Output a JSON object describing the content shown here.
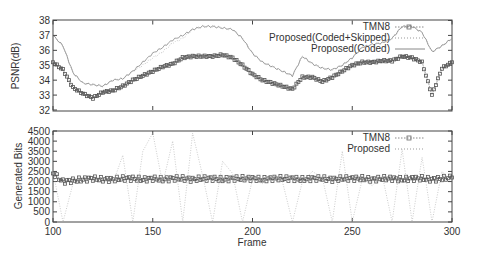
{
  "chart_data": [
    {
      "type": "line",
      "title": "",
      "xlabel": "",
      "ylabel": "PSNR(dB)",
      "xlim": [
        100,
        300
      ],
      "ylim": [
        32,
        38
      ],
      "yticks": [
        32,
        33,
        34,
        35,
        36,
        37,
        38
      ],
      "xticks": [
        100,
        150,
        200,
        250,
        300
      ],
      "grid": false,
      "legend_position": "top-right",
      "x": [
        100,
        105,
        110,
        115,
        120,
        125,
        130,
        135,
        140,
        145,
        150,
        155,
        160,
        165,
        170,
        175,
        180,
        185,
        190,
        195,
        200,
        205,
        210,
        215,
        220,
        225,
        230,
        235,
        240,
        245,
        250,
        255,
        260,
        265,
        270,
        275,
        280,
        285,
        290,
        295,
        300
      ],
      "series": [
        {
          "name": "TMN8",
          "style": "dotted with square markers",
          "values": [
            35.2,
            34.7,
            33.5,
            33.1,
            32.8,
            33.2,
            33.3,
            33.6,
            34.0,
            34.3,
            34.6,
            34.9,
            35.1,
            35.5,
            35.6,
            35.6,
            35.6,
            35.7,
            35.5,
            35.0,
            34.4,
            34.0,
            33.8,
            33.6,
            33.4,
            34.2,
            34.2,
            33.9,
            34.2,
            34.6,
            35.0,
            35.2,
            35.2,
            35.3,
            35.3,
            35.6,
            35.5,
            35.2,
            33.0,
            34.8,
            35.2
          ]
        },
        {
          "name": "Proposed(Coded+Skipped)",
          "style": "dotted with small markers, drops at skipped frames",
          "values": [
            37.0,
            36.3,
            34.5,
            33.8,
            33.7,
            33.6,
            34.0,
            34.1,
            34.6,
            35.0,
            35.5,
            35.9,
            36.5,
            36.8,
            37.4,
            37.6,
            37.6,
            37.5,
            37.4,
            36.8,
            35.8,
            35.2,
            34.9,
            34.6,
            34.3,
            35.6,
            35.1,
            34.8,
            34.7,
            35.0,
            35.5,
            36.2,
            36.4,
            36.5,
            36.8,
            37.6,
            37.6,
            37.2,
            35.9,
            36.3,
            36.8
          ]
        },
        {
          "name": "Proposed(Coded)",
          "style": "solid thin line",
          "values": [
            37.0,
            36.3,
            34.5,
            33.8,
            33.7,
            33.6,
            34.0,
            34.1,
            34.6,
            35.2,
            35.8,
            36.2,
            36.7,
            37.0,
            37.4,
            37.6,
            37.6,
            37.5,
            37.4,
            36.8,
            35.8,
            35.2,
            34.9,
            34.6,
            34.3,
            35.6,
            35.1,
            34.8,
            34.7,
            35.0,
            35.5,
            36.2,
            36.4,
            36.5,
            36.8,
            37.6,
            37.6,
            37.2,
            35.9,
            36.3,
            36.8
          ]
        }
      ]
    },
    {
      "type": "line",
      "title": "",
      "xlabel": "Frame",
      "ylabel": "Generated Bits",
      "xlim": [
        100,
        300
      ],
      "ylim": [
        0,
        4500
      ],
      "yticks": [
        0,
        500,
        1000,
        1500,
        2000,
        2500,
        3000,
        3500,
        4000,
        4500
      ],
      "xticks": [
        100,
        150,
        200,
        250,
        300
      ],
      "grid": false,
      "legend_position": "top-right",
      "x": [
        100,
        105,
        110,
        115,
        120,
        125,
        130,
        135,
        140,
        145,
        150,
        155,
        160,
        165,
        170,
        175,
        180,
        185,
        190,
        195,
        200,
        205,
        210,
        215,
        220,
        225,
        230,
        235,
        240,
        245,
        250,
        255,
        260,
        265,
        270,
        275,
        280,
        285,
        290,
        295,
        300
      ],
      "series": [
        {
          "name": "TMN8",
          "style": "dotted with square markers",
          "values": [
            2400,
            2000,
            2050,
            2100,
            2150,
            2100,
            2100,
            2150,
            2150,
            2100,
            2150,
            2100,
            2150,
            2150,
            2100,
            2150,
            2150,
            2100,
            2150,
            2150,
            2150,
            2100,
            2150,
            2150,
            2150,
            2100,
            2150,
            2150,
            2100,
            2150,
            2150,
            2150,
            2100,
            2150,
            2150,
            2100,
            2150,
            2150,
            2100,
            2150,
            2200
          ]
        },
        {
          "name": "Proposed",
          "style": "dotted with small markers, spikes to 0 at skipped frames",
          "values": [
            2500,
            0,
            1900,
            2100,
            2000,
            2200,
            1900,
            3300,
            0,
            3500,
            4400,
            1900,
            4000,
            0,
            4400,
            2300,
            0,
            3000,
            2400,
            0,
            2100,
            1900,
            2300,
            2000,
            0,
            2000,
            2500,
            2200,
            0,
            3500,
            0,
            2100,
            1800,
            2300,
            0,
            3600,
            0,
            3200,
            0,
            2500,
            2000
          ]
        }
      ]
    }
  ],
  "top_chart": {
    "ylabel": "PSNR(dB)",
    "yticks": [
      "32",
      "33",
      "34",
      "35",
      "36",
      "37",
      "38"
    ],
    "legend": [
      "TMN8",
      "Proposed(Coded+Skipped)",
      "Proposed(Coded)"
    ]
  },
  "bottom_chart": {
    "ylabel": "Generated Bits",
    "xlabel": "Frame",
    "yticks": [
      "0",
      "500",
      "1000",
      "1500",
      "2000",
      "2500",
      "3000",
      "3500",
      "4000",
      "4500"
    ],
    "xticks": [
      "100",
      "150",
      "200",
      "250",
      "300"
    ],
    "legend": [
      "TMN8",
      "Proposed"
    ]
  }
}
